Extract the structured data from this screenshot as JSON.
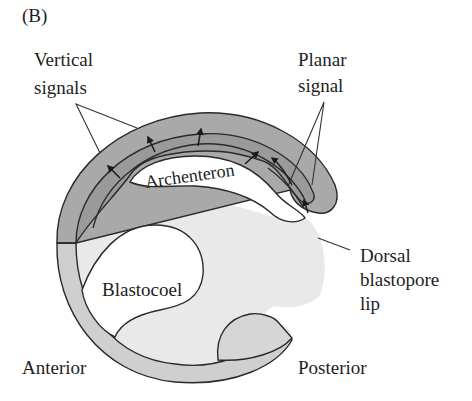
{
  "panel_label": "(B)",
  "labels": {
    "vertical_signals": [
      "Vertical",
      "signals"
    ],
    "planar_signal": [
      "Planar",
      "signal"
    ],
    "archenteron": "Archenteron",
    "dorsal_blastopore_lip": [
      "Dorsal",
      "blastopore",
      "lip"
    ],
    "blastocoel": "Blastocoel",
    "anterior": "Anterior",
    "posterior": "Posterior"
  },
  "colors": {
    "outer_ectoderm_dark": "#a9a9a9",
    "mesoderm_dark": "#9a9a9a",
    "outer_ectoderm_light": "#cfcfcf",
    "endoderm_fill": "#e9e9e9",
    "cavity_fill": "#ffffff",
    "line": "#2a2a2a"
  }
}
